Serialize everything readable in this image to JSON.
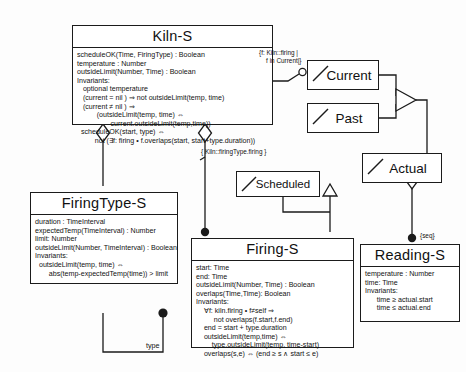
{
  "diagram": {
    "classes": [
      {
        "id": "kiln",
        "name": "Kiln-S",
        "body": "scheduleOK(Time, FiringType) : Boolean\ntemperature : Number\noutsideLimit(Number, Time) : Boolean\nInvariants:\n   optional temperature\n   (current = nil ) ⇒ not outsideLimit(temp, time)\n   (current ≠ nil ) ⇒\n          (outsideLimit(temp, time) ⇔\n                 current.outsideLimit(temp,time))\n  scheduleOK(start, type) ⇔\n         not (∃f: firing • f.overlaps(start, start+type.duration))"
      },
      {
        "id": "firingtype",
        "name": "FiringType-S",
        "body": "duration : TimeInterval\nexpectedTemp(TimeInterval) : Number\nlimit: Number\noutsideLimit(Number, TimeInterval) : Boolean\nInvariants:\n  outsideLimit(temp, time) ⇔\n       abs(temp-expectedTemp(time)) > limit"
      },
      {
        "id": "firing",
        "name": "Firing-S",
        "body": "start: Time\nend: Time\noutsideLimit(Number, Time) : Boolean\noverlaps(Time,Time): Boolean\nInvariants:\n    ∀f: kiln.firing • f≠self ⇒\n         not overlaps(f.start,f.end)\n    end = start + type.duration\n    outsideLimit(temp,time) ⇔\n        type.outsideLimit(temp, time-start)\n    overlaps(s,e) ⇔ (end ≥ s ∧ start ≤ e)"
      },
      {
        "id": "reading",
        "name": "Reading-S",
        "body": "temperature : Number\ntime: Time\nInvariants:\n      time ≥ actual.start\n      time ≤ actual.end"
      }
    ],
    "subset_boxes": [
      {
        "id": "current",
        "label": "Current"
      },
      {
        "id": "past",
        "label": "Past"
      },
      {
        "id": "actual",
        "label": "Actual"
      },
      {
        "id": "scheduled",
        "label": "Scheduled"
      }
    ],
    "annotations": [
      {
        "id": "current-constraint",
        "text": "{f: Kiln::firing |\n    f in Current|}"
      },
      {
        "id": "firingtype-constraint",
        "text": "{ Kiln::firingType.firing }"
      },
      {
        "id": "seq-constraint",
        "text": "{seq}"
      },
      {
        "id": "type-role",
        "text": "type"
      }
    ],
    "colors": {
      "line": "#1b1b1b",
      "fill": "#ffffff",
      "text": "#111111"
    }
  }
}
